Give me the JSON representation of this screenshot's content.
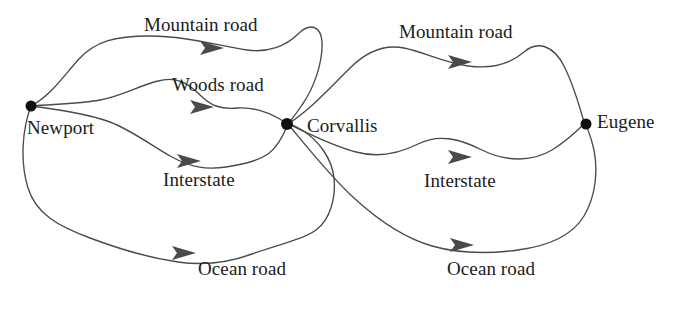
{
  "diagram": {
    "background_color": "#ffffff",
    "edge_color": "#4a4a4a",
    "node_color": "#101010",
    "text_color": "#1b1b1b",
    "nodes": [
      {
        "id": "newport",
        "label": "Newport",
        "x": 31,
        "y": 106,
        "label_x": 27,
        "label_y": 117
      },
      {
        "id": "corvallis",
        "label": "Corvallis",
        "x": 287,
        "y": 124,
        "label_x": 307,
        "label_y": 115
      },
      {
        "id": "eugene",
        "label": "Eugene",
        "x": 586,
        "y": 124,
        "label_x": 597,
        "label_y": 111
      }
    ],
    "edges": [
      {
        "id": "newport-corvallis-mountain",
        "label": "Mountain road",
        "from": "newport",
        "to": "corvallis",
        "label_x": 144,
        "label_y": 14,
        "arrow_x": 213,
        "arrow_y": 48
      },
      {
        "id": "newport-corvallis-woods",
        "label": "Woods road",
        "from": "newport",
        "to": "corvallis",
        "label_x": 172,
        "label_y": 74,
        "arrow_x": 203,
        "arrow_y": 107
      },
      {
        "id": "newport-corvallis-interstate",
        "label": "Interstate",
        "from": "newport",
        "to": "corvallis",
        "label_x": 163,
        "label_y": 169,
        "arrow_x": 190,
        "arrow_y": 161
      },
      {
        "id": "newport-corvallis-ocean",
        "label": "Ocean road",
        "from": "newport",
        "to": "corvallis",
        "label_x": 198,
        "label_y": 258,
        "arrow_x": 185,
        "arrow_y": 253
      },
      {
        "id": "corvallis-eugene-mountain",
        "label": "Mountain road",
        "from": "corvallis",
        "to": "eugene",
        "label_x": 399,
        "label_y": 21,
        "arrow_x": 460,
        "arrow_y": 62
      },
      {
        "id": "corvallis-eugene-interstate",
        "label": "Interstate",
        "from": "corvallis",
        "to": "eugene",
        "label_x": 424,
        "label_y": 170,
        "arrow_x": 460,
        "arrow_y": 157
      },
      {
        "id": "corvallis-eugene-ocean",
        "label": "Ocean road",
        "from": "corvallis",
        "to": "eugene",
        "label_x": 447,
        "label_y": 258,
        "arrow_x": 462,
        "arrow_y": 245
      }
    ]
  }
}
